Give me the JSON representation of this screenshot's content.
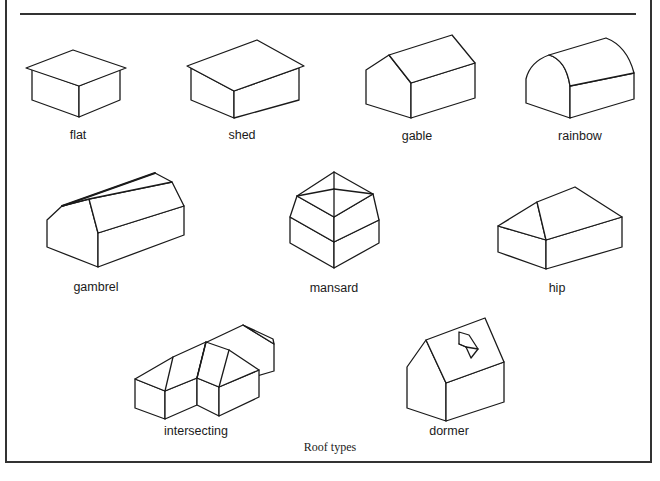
{
  "figure": {
    "caption": "Roof types",
    "stroke_color": "#1a1a1a",
    "background": "#ffffff"
  },
  "roofs": [
    {
      "id": "flat",
      "label": "flat"
    },
    {
      "id": "shed",
      "label": "shed"
    },
    {
      "id": "gable",
      "label": "gable"
    },
    {
      "id": "rainbow",
      "label": "rainbow"
    },
    {
      "id": "gambrel",
      "label": "gambrel"
    },
    {
      "id": "mansard",
      "label": "mansard"
    },
    {
      "id": "hip",
      "label": "hip"
    },
    {
      "id": "intersecting",
      "label": "intersecting"
    },
    {
      "id": "dormer",
      "label": "dormer"
    }
  ]
}
